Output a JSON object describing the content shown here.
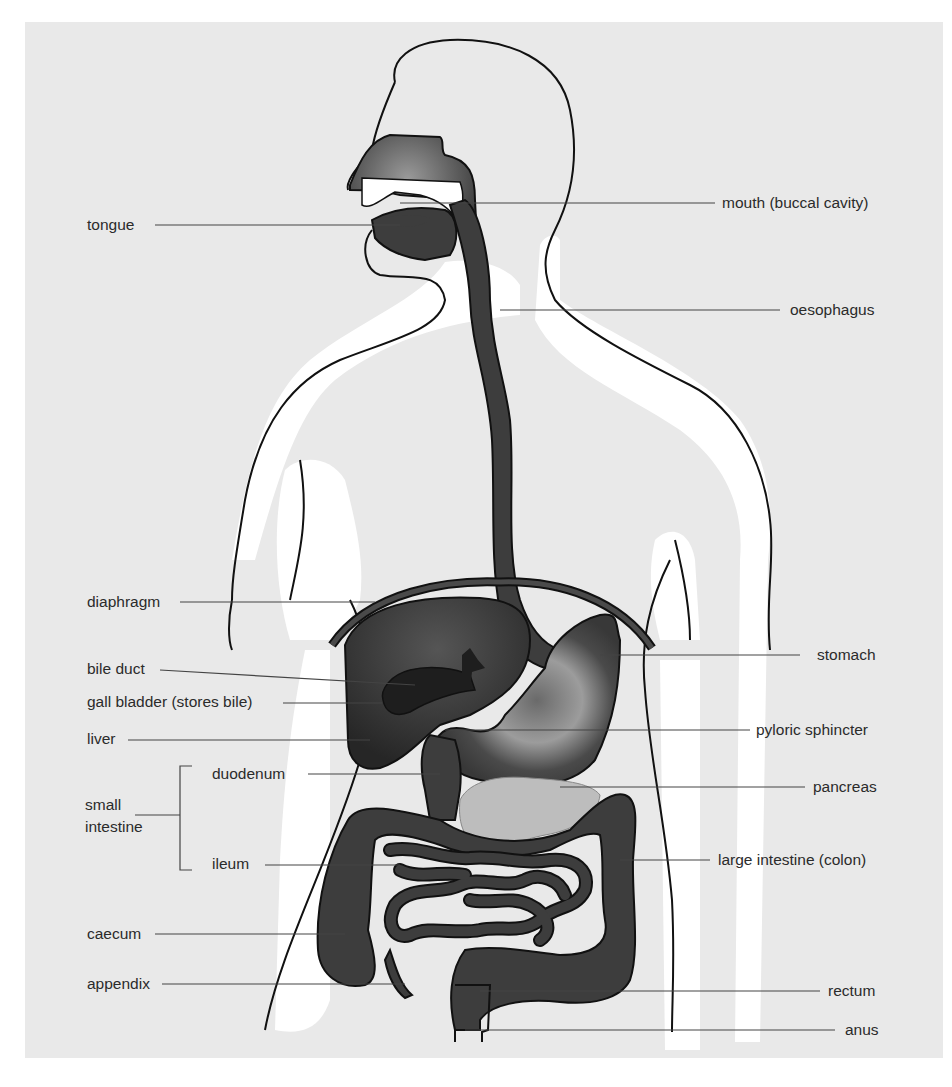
{
  "figure": {
    "colors": {
      "background": "#e9e9e9",
      "body_highlight": "#ffffff",
      "organ_dark": "#3d3d3d",
      "organ_outline": "#111111",
      "pancreas": "#bdbdbd",
      "leader_line": "#444444",
      "label_text": "#2b2b2b"
    },
    "labels_left": [
      {
        "id": "tongue",
        "text": "tongue"
      },
      {
        "id": "diaphragm",
        "text": "diaphragm"
      },
      {
        "id": "bile-duct",
        "text": "bile duct"
      },
      {
        "id": "gall-bladder",
        "text": "gall bladder (stores bile)"
      },
      {
        "id": "liver",
        "text": "liver"
      },
      {
        "id": "duodenum",
        "text": "duodenum"
      },
      {
        "id": "small-intestine-line1",
        "text": "small"
      },
      {
        "id": "small-intestine-line2",
        "text": "intestine"
      },
      {
        "id": "ileum",
        "text": "ileum"
      },
      {
        "id": "caecum",
        "text": "caecum"
      },
      {
        "id": "appendix",
        "text": "appendix"
      }
    ],
    "labels_right": [
      {
        "id": "mouth",
        "text": "mouth (buccal cavity)"
      },
      {
        "id": "oesophagus",
        "text": "oesophagus"
      },
      {
        "id": "stomach",
        "text": "stomach"
      },
      {
        "id": "pyloric-sphincter",
        "text": "pyloric sphincter"
      },
      {
        "id": "pancreas",
        "text": "pancreas"
      },
      {
        "id": "large-intestine",
        "text": "large intestine (colon)"
      },
      {
        "id": "rectum",
        "text": "rectum"
      },
      {
        "id": "anus",
        "text": "anus"
      }
    ]
  }
}
